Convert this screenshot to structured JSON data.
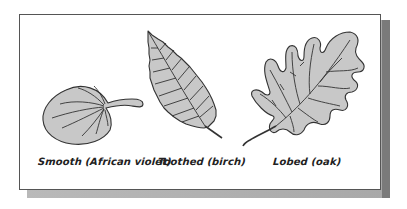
{
  "figure": {
    "colors": {
      "leaf_fill": "#c8c8c8",
      "leaf_stroke": "#333333",
      "panel_border": "#555555",
      "shadow": "#a8a8a8"
    },
    "leaves": [
      {
        "id": "smooth",
        "label": "Smooth (African violet)"
      },
      {
        "id": "toothed",
        "label": "Toothed (birch)"
      },
      {
        "id": "lobed",
        "label": "Lobed (oak)"
      }
    ]
  }
}
